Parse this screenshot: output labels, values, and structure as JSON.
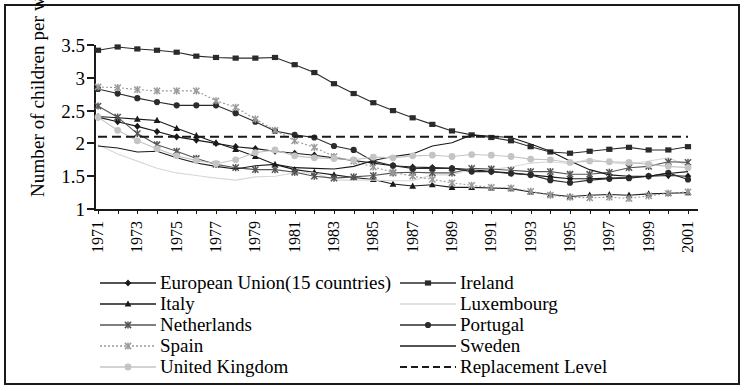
{
  "chart_data": {
    "type": "line",
    "title": "",
    "xlabel": "",
    "ylabel": "Number of children per woman",
    "ylim": [
      1,
      3.5
    ],
    "yticks": [
      1,
      1.5,
      2,
      2.5,
      3,
      3.5
    ],
    "ytick_labels": [
      "1",
      "1.5",
      "2",
      "2.5",
      "3",
      "3.5"
    ],
    "xlim": [
      1971,
      2001
    ],
    "x": [
      1971,
      1972,
      1973,
      1974,
      1975,
      1976,
      1977,
      1978,
      1979,
      1980,
      1981,
      1982,
      1983,
      1984,
      1985,
      1986,
      1987,
      1988,
      1989,
      1990,
      1991,
      1992,
      1993,
      1994,
      1995,
      1996,
      1997,
      1998,
      1999,
      2000,
      2001
    ],
    "xtick_labels": [
      "1971",
      "1973",
      "1975",
      "1977",
      "1979",
      "1981",
      "1983",
      "1985",
      "1987",
      "1989",
      "1991",
      "1993",
      "1995",
      "1997",
      "1999",
      "2001"
    ],
    "grid": false,
    "legend_position": "bottom",
    "series": [
      {
        "name": "European Union(15 countries)",
        "marker": "diamond",
        "color": "#1a1a1a",
        "line": "solid",
        "values": [
          2.4,
          2.33,
          2.26,
          2.18,
          2.1,
          2.05,
          2.0,
          1.95,
          1.92,
          1.88,
          1.85,
          1.82,
          1.78,
          1.74,
          1.7,
          1.66,
          1.64,
          1.63,
          1.62,
          1.6,
          1.57,
          1.55,
          1.52,
          1.49,
          1.46,
          1.46,
          1.47,
          1.48,
          1.5,
          1.51,
          1.5
        ]
      },
      {
        "name": "Ireland",
        "marker": "square",
        "color": "#2b2b2b",
        "line": "solid",
        "values": [
          3.42,
          3.47,
          3.44,
          3.42,
          3.39,
          3.33,
          3.31,
          3.3,
          3.3,
          3.31,
          3.2,
          3.08,
          2.91,
          2.76,
          2.62,
          2.5,
          2.39,
          2.29,
          2.19,
          2.13,
          2.09,
          2.04,
          1.95,
          1.87,
          1.85,
          1.88,
          1.91,
          1.94,
          1.9,
          1.9,
          1.95
        ]
      },
      {
        "name": "Italy",
        "marker": "triangle",
        "color": "#1a1a1a",
        "line": "solid",
        "values": [
          2.41,
          2.39,
          2.37,
          2.35,
          2.23,
          2.12,
          2.01,
          1.91,
          1.8,
          1.68,
          1.6,
          1.56,
          1.52,
          1.48,
          1.45,
          1.38,
          1.35,
          1.37,
          1.33,
          1.33,
          1.32,
          1.31,
          1.26,
          1.22,
          1.19,
          1.21,
          1.22,
          1.21,
          1.23,
          1.24,
          1.25
        ]
      },
      {
        "name": "Luxembourg",
        "marker": "none",
        "color": "#d8d8d8",
        "line": "solid",
        "values": [
          1.98,
          1.84,
          1.73,
          1.62,
          1.55,
          1.51,
          1.47,
          1.44,
          1.49,
          1.5,
          1.55,
          1.55,
          1.44,
          1.44,
          1.44,
          1.43,
          1.43,
          1.52,
          1.52,
          1.61,
          1.6,
          1.64,
          1.7,
          1.72,
          1.69,
          1.76,
          1.71,
          1.68,
          1.73,
          1.78,
          1.66
        ]
      },
      {
        "name": "Netherlands",
        "marker": "cross",
        "color": "#555555",
        "line": "solid",
        "values": [
          2.57,
          2.4,
          2.15,
          1.98,
          1.88,
          1.77,
          1.68,
          1.63,
          1.6,
          1.6,
          1.56,
          1.5,
          1.47,
          1.49,
          1.51,
          1.55,
          1.56,
          1.55,
          1.55,
          1.62,
          1.61,
          1.59,
          1.57,
          1.57,
          1.53,
          1.53,
          1.56,
          1.63,
          1.65,
          1.72,
          1.71
        ]
      },
      {
        "name": "Portugal",
        "marker": "circle",
        "color": "#2b2b2b",
        "line": "solid",
        "values": [
          2.83,
          2.76,
          2.69,
          2.63,
          2.58,
          2.58,
          2.58,
          2.46,
          2.33,
          2.19,
          2.13,
          2.09,
          1.96,
          1.9,
          1.73,
          1.66,
          1.62,
          1.62,
          1.62,
          1.57,
          1.57,
          1.54,
          1.52,
          1.44,
          1.4,
          1.44,
          1.46,
          1.47,
          1.5,
          1.55,
          1.45
        ]
      },
      {
        "name": "Spain",
        "marker": "cross",
        "color": "#9a9a9a",
        "line": "dotted",
        "values": [
          2.86,
          2.85,
          2.82,
          2.8,
          2.8,
          2.8,
          2.65,
          2.55,
          2.37,
          2.2,
          2.04,
          1.94,
          1.8,
          1.73,
          1.64,
          1.56,
          1.5,
          1.45,
          1.4,
          1.36,
          1.33,
          1.32,
          1.27,
          1.21,
          1.18,
          1.17,
          1.18,
          1.16,
          1.2,
          1.24,
          1.26
        ]
      },
      {
        "name": "Sweden",
        "marker": "none",
        "color": "#1a1a1a",
        "line": "solid",
        "values": [
          1.96,
          1.93,
          1.87,
          1.88,
          1.78,
          1.7,
          1.65,
          1.61,
          1.66,
          1.68,
          1.63,
          1.62,
          1.61,
          1.65,
          1.74,
          1.8,
          1.84,
          1.96,
          2.01,
          2.13,
          2.11,
          2.09,
          1.99,
          1.88,
          1.73,
          1.6,
          1.52,
          1.5,
          1.5,
          1.54,
          1.57
        ]
      },
      {
        "name": "United Kingdom",
        "marker": "dot",
        "color": "#c4c4c4",
        "line": "solid",
        "values": [
          2.4,
          2.2,
          2.04,
          1.92,
          1.81,
          1.74,
          1.69,
          1.75,
          1.86,
          1.9,
          1.81,
          1.78,
          1.77,
          1.75,
          1.79,
          1.78,
          1.81,
          1.82,
          1.8,
          1.83,
          1.82,
          1.8,
          1.76,
          1.75,
          1.71,
          1.73,
          1.72,
          1.71,
          1.68,
          1.65,
          1.63
        ]
      },
      {
        "name": "Replacement Level",
        "marker": "none",
        "color": "#1a1a1a",
        "line": "dashed",
        "values": [
          2.1,
          2.1,
          2.1,
          2.1,
          2.1,
          2.1,
          2.1,
          2.1,
          2.1,
          2.1,
          2.1,
          2.1,
          2.1,
          2.1,
          2.1,
          2.1,
          2.1,
          2.1,
          2.1,
          2.1,
          2.1,
          2.1,
          2.1,
          2.1,
          2.1,
          2.1,
          2.1,
          2.1,
          2.1,
          2.1,
          2.1
        ]
      }
    ]
  },
  "legend": {
    "left_column": [
      "European Union(15 countries)",
      "Italy",
      "Netherlands",
      "Spain",
      "United Kingdom"
    ],
    "right_column": [
      "Ireland",
      "Luxembourg",
      "Portugal",
      "Sweden",
      "Replacement Level"
    ]
  }
}
